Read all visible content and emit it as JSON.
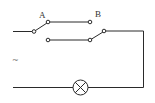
{
  "diagram": {
    "type": "circuit",
    "labels": {
      "switch_a": "A",
      "switch_b": "B",
      "source": "~"
    },
    "components": [
      {
        "id": "source",
        "kind": "ac-source",
        "label": "~"
      },
      {
        "id": "switch_a",
        "kind": "spdt-switch",
        "label": "A",
        "position": "upper-contact"
      },
      {
        "id": "switch_b",
        "kind": "spdt-switch",
        "label": "B",
        "position": "lower-contact"
      },
      {
        "id": "lamp",
        "kind": "lamp"
      }
    ],
    "colors": {
      "line": "#2a2a2a",
      "background": "#ffffff"
    }
  }
}
